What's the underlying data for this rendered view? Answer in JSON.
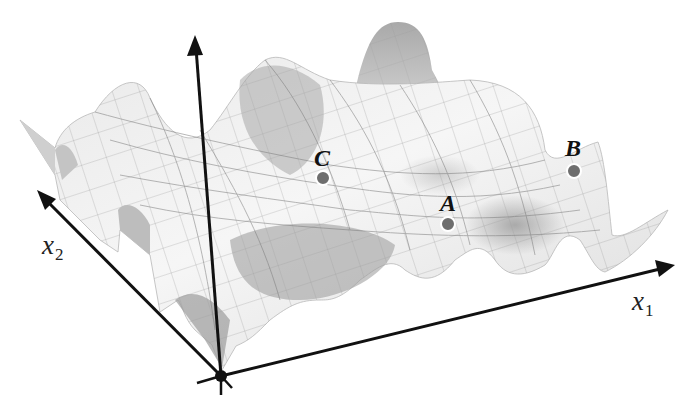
{
  "figure": {
    "type": "3d-surface-plot",
    "colors": {
      "background": "#ffffff",
      "axis": "#111111",
      "surface_light": "#f2f2f2",
      "surface_mid": "#d4d4d4",
      "surface_dark": "#9a9a9a",
      "mesh": "#8c8c8c",
      "point_fill": "#6e6e6e",
      "point_stroke": "#ffffff"
    }
  },
  "axes": {
    "x1": {
      "name": "x",
      "sub": "1"
    },
    "x2": {
      "name": "x",
      "sub": "2"
    },
    "vertical": {
      "name": ""
    }
  },
  "points": [
    {
      "label": "C",
      "note": "point on surface near central ridge"
    },
    {
      "label": "A",
      "note": "point in lower valley"
    },
    {
      "label": "B",
      "note": "point on right ridge"
    }
  ]
}
